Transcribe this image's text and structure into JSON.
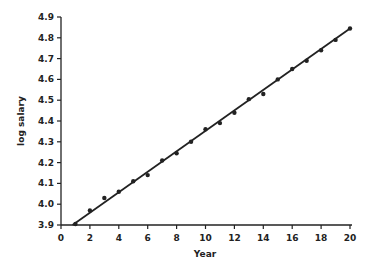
{
  "chart_data": {
    "type": "scatter",
    "title": "",
    "xlabel": "Year",
    "ylabel": "log salary",
    "xlim": [
      0,
      20
    ],
    "ylim": [
      3.9,
      4.9
    ],
    "grid": false,
    "legend": null,
    "x_ticks": [
      "0",
      "2",
      "4",
      "6",
      "8",
      "10",
      "12",
      "14",
      "16",
      "18",
      "20"
    ],
    "y_ticks": [
      "3.9",
      "4.0",
      "4.1",
      "4.2",
      "4.3",
      "4.4",
      "4.5",
      "4.6",
      "4.7",
      "4.8",
      "4.9"
    ],
    "series": [
      {
        "name": "observed",
        "type": "scatter",
        "x": [
          1,
          2,
          3,
          4,
          5,
          6,
          7,
          8,
          9,
          10,
          11,
          12,
          13,
          14,
          15,
          16,
          17,
          18,
          19,
          20
        ],
        "y": [
          3.905,
          3.97,
          4.03,
          4.06,
          4.11,
          4.14,
          4.21,
          4.245,
          4.3,
          4.36,
          4.39,
          4.44,
          4.505,
          4.53,
          4.6,
          4.65,
          4.69,
          4.74,
          4.79,
          4.845
        ]
      },
      {
        "name": "fitted line",
        "type": "line",
        "x": [
          0.8,
          20
        ],
        "y": [
          3.9,
          4.845
        ]
      }
    ],
    "colors": {
      "points": "#222222",
      "line": "#222222",
      "axis": "#222222"
    }
  }
}
